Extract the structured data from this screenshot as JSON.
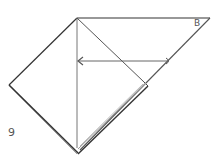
{
  "diagram": {
    "type": "origami-fold-instruction",
    "step_number": "9",
    "point_label": "B",
    "colors": {
      "line": "#333333",
      "fold_line": "#777777",
      "arrow": "#666666",
      "layer_edge": "#999999",
      "background": "#ffffff"
    }
  }
}
